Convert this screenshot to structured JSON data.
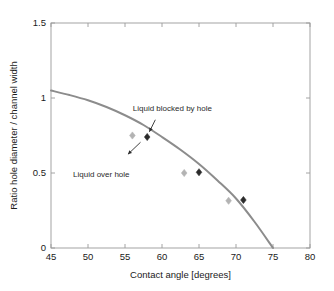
{
  "chart_data": {
    "type": "scatter",
    "title": "",
    "xlabel": "Contact angle [degrees]",
    "ylabel": "Ratio  hole diameter / channel width",
    "xlim": [
      45,
      80
    ],
    "ylim": [
      0,
      1.5
    ],
    "xticks": [
      45,
      50,
      55,
      60,
      65,
      70,
      75,
      80
    ],
    "xtick_labels": [
      "45",
      "50",
      "55",
      "60",
      "65",
      "70",
      "75",
      "80"
    ],
    "yticks": [
      0,
      0.5,
      1,
      1.5
    ],
    "ytick_labels": [
      "0",
      "0.5",
      "1",
      "1.5"
    ],
    "grid": false,
    "legend": "none",
    "series": [
      {
        "name": "Theoretical curve",
        "type": "line",
        "color": "#8c8c8c",
        "x": [
          45,
          47.5,
          50,
          52.5,
          55,
          57.5,
          60,
          62.5,
          65,
          67.5,
          70,
          72.5,
          75
        ],
        "y": [
          1.05,
          1.02,
          0.985,
          0.94,
          0.885,
          0.82,
          0.74,
          0.655,
          0.56,
          0.45,
          0.33,
          0.175,
          0.0
        ]
      },
      {
        "name": "Liquid over hole",
        "type": "scatter",
        "marker": "diamond",
        "color": "#b3b3b3",
        "x": [
          56,
          63,
          69
        ],
        "y": [
          0.75,
          0.5,
          0.315
        ]
      },
      {
        "name": "Liquid blocked by hole",
        "type": "scatter",
        "marker": "diamond",
        "color": "#2b2b2b",
        "x": [
          58,
          65,
          71
        ],
        "y": [
          0.74,
          0.505,
          0.32
        ]
      }
    ],
    "annotations": [
      {
        "text": "Liquid blocked by hole",
        "text_x": 61.4,
        "text_y": 0.915,
        "arrow_from_x": 59.1,
        "arrow_from_y": 0.855,
        "arrow_to_x": 58.3,
        "arrow_to_y": 0.775
      },
      {
        "text": "Liquid over hole",
        "text_x": 51.8,
        "text_y": 0.475,
        "arrow_from_x": 57.1,
        "arrow_from_y": 0.705,
        "arrow_to_x": 55.4,
        "arrow_to_y": 0.625
      }
    ]
  }
}
